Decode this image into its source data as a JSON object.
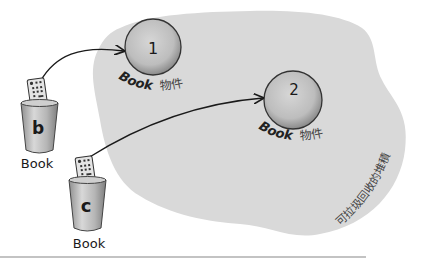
{
  "diagram": {
    "heap": {
      "label": "可拉圾回收的堆積",
      "fill": "#d9d9d9"
    },
    "objects": [
      {
        "id": "1",
        "number": "1",
        "type_label": "Book",
        "suffix_label": "物件"
      },
      {
        "id": "2",
        "number": "2",
        "type_label": "Book",
        "suffix_label": "物件"
      }
    ],
    "references": [
      {
        "var": "b",
        "type_label": "Book",
        "points_to": "1"
      },
      {
        "var": "c",
        "type_label": "Book",
        "points_to": "2"
      }
    ],
    "colors": {
      "heap_fill": "#d9d9d9",
      "object_fill": "#c4c4c4",
      "object_stroke": "#333333",
      "can_fill": "#b8b8b8",
      "arrow": "#1a1a1a",
      "rule": "#888888"
    }
  }
}
